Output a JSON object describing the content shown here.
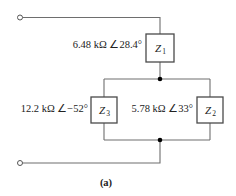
{
  "diagram": {
    "caption": "(a)",
    "impedances": [
      {
        "id": "Z1",
        "symbol": "Z",
        "subscript": "1",
        "value_label": "6.48 kΩ ∠28.4°"
      },
      {
        "id": "Z2",
        "symbol": "Z",
        "subscript": "2",
        "value_label": "5.78 kΩ ∠33°"
      },
      {
        "id": "Z3",
        "symbol": "Z",
        "subscript": "3",
        "value_label": "12.2 kΩ ∠−52°"
      }
    ],
    "terminals": [
      "top-terminal",
      "bottom-terminal"
    ],
    "topology": "Z1 in series with parallel combination of Z3 and Z2",
    "colors": {
      "wire": "#6e6e6e",
      "box": "#4a4a4a",
      "node": "#000000",
      "text": "#222222"
    }
  }
}
